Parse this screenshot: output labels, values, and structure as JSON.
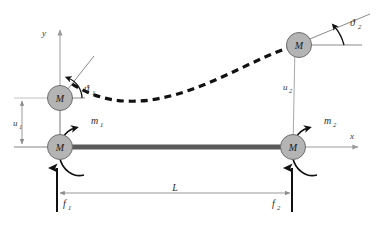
{
  "figure": {
    "axes": {
      "x_label": "x",
      "y_label": "y"
    },
    "masses": [
      {
        "id": "mass-1-deformed",
        "label": "M",
        "cx": 60,
        "cy": 98
      },
      {
        "id": "mass-1-undeformed",
        "label": "M",
        "cx": 60,
        "cy": 147
      },
      {
        "id": "mass-2-deformed",
        "label": "M",
        "cx": 299,
        "cy": 45
      },
      {
        "id": "mass-2-undeformed",
        "label": "M",
        "cx": 293,
        "cy": 147
      }
    ],
    "displacements": [
      {
        "id": "u1",
        "label": "u",
        "subscript": "1"
      },
      {
        "id": "u2",
        "label": "u",
        "subscript": "2"
      }
    ],
    "rotations": [
      {
        "id": "theta1",
        "label": "ϑ",
        "subscript": "1"
      },
      {
        "id": "theta2",
        "label": "ϑ",
        "subscript": "2"
      }
    ],
    "moments": [
      {
        "id": "m1",
        "label": "m",
        "subscript": "1",
        "sense": "counterclockwise"
      },
      {
        "id": "m2",
        "label": "m",
        "subscript": "2",
        "sense": "counterclockwise"
      }
    ],
    "forces": [
      {
        "id": "f1",
        "label": "f",
        "subscript": "1",
        "direction": "up"
      },
      {
        "id": "f2",
        "label": "f",
        "subscript": "2",
        "direction": "up"
      }
    ],
    "length": {
      "id": "L",
      "label": "L"
    },
    "colors": {
      "mass_fill": "#b4b4b4",
      "mass_stroke": "#6e6e6e",
      "beam": "#5a5a5a",
      "axis": "#9a9a9a",
      "dimension": "#8c8c8c",
      "deflection_curve": "#111111",
      "force_arrow": "#111111",
      "moment_arrow": "#111111",
      "tangent_line": "#8a8a8a",
      "text": "#2b2b2b",
      "background": "#ffffff"
    }
  }
}
